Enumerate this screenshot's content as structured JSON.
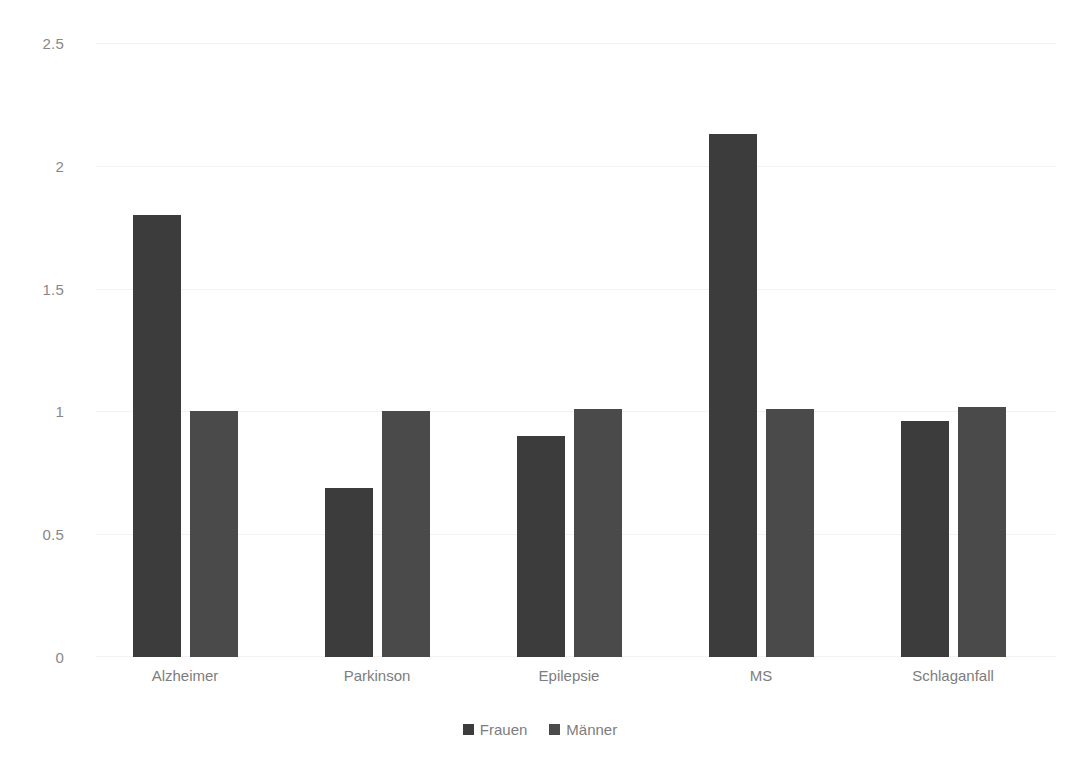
{
  "chart_data": {
    "type": "bar",
    "title": "",
    "subtitle": "",
    "xlabel": "",
    "ylabel": "",
    "categories": [
      "Alzheimer",
      "Parkinson",
      "Epilepsie",
      "MS",
      "Schlaganfall"
    ],
    "series": [
      {
        "name": "Frauen",
        "color": "#3c3c3c",
        "values": [
          1.8,
          0.69,
          0.9,
          2.13,
          0.96
        ]
      },
      {
        "name": "Männer",
        "color": "#4a4a4a",
        "values": [
          1.0,
          1.0,
          1.01,
          1.01,
          1.02
        ]
      }
    ],
    "ylim": [
      0,
      2.5
    ],
    "ytick_labels": [
      "2.5",
      "2",
      "1.5",
      "1",
      "0.5",
      "0"
    ],
    "ytick_values": [
      2.5,
      2,
      1.5,
      1,
      0.5,
      0
    ],
    "grid": true,
    "grid_axis": "y",
    "legend_position": "bottom",
    "annotations": []
  },
  "axis": {
    "y_labels": [
      "2.5",
      "2",
      "1.5",
      "1",
      "0.5",
      "0"
    ],
    "x_labels": [
      "Alzheimer",
      "Parkinson",
      "Epilepsie",
      "MS",
      "Schlaganfall"
    ]
  },
  "legend": {
    "items": [
      {
        "label": "Frauen",
        "color": "#3c3c3c"
      },
      {
        "label": "Männer",
        "color": "#4a4a4a"
      }
    ]
  },
  "colors": {
    "background": "#ffffff",
    "gridline": "#f2f2f2",
    "tick_text": "#7d7d7d",
    "series_frauen": "#3c3c3c",
    "series_manner": "#4a4a4a"
  }
}
